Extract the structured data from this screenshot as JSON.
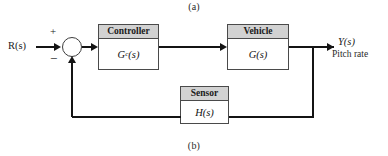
{
  "figure": {
    "caption_top": "(a)",
    "caption_bottom": "(b)"
  },
  "signals": {
    "input_label": "R(s)",
    "output_label": "Y(s)",
    "output_description": "Pitch rate"
  },
  "summing_junction": {
    "positive_sign": "+",
    "negative_sign": "−"
  },
  "blocks": {
    "controller": {
      "title": "Controller",
      "transfer_function_base": "G",
      "transfer_function_subscript": "c",
      "transfer_function_arg": "(s)"
    },
    "vehicle": {
      "title": "Vehicle",
      "transfer_function": "G(s)"
    },
    "sensor": {
      "title": "Sensor",
      "transfer_function": "H(s)"
    }
  },
  "colors": {
    "header_fill": "#d2d2d2",
    "block_border": "#4a4a4a",
    "wire": "#141414",
    "background": "#ffffff"
  }
}
